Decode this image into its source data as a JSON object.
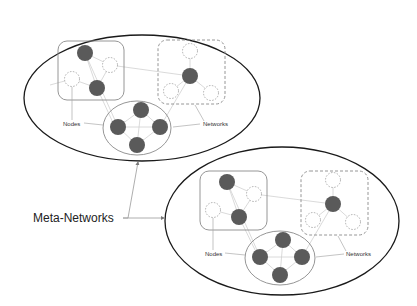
{
  "diagram": {
    "labels": {
      "meta_networks": "Meta-Networks",
      "nodes": "Nodes",
      "networks": "Networks"
    },
    "colors": {
      "background": "#ffffff",
      "outer_ellipse_stroke": "#1a1a1a",
      "box_stroke": "#8a8a8a",
      "filled_node": "#5a5a5a",
      "empty_node_stroke": "#9a9a9a",
      "edge": "#cfcfcf",
      "connector": "#9a9a9a"
    },
    "meta_networks": [
      {
        "id": "top-left",
        "nodes_label": "Nodes",
        "networks_label": "Networks",
        "solid_network": {
          "filled_nodes": 2,
          "empty_nodes": 2
        },
        "dashed_network": {
          "filled_nodes": 1,
          "empty_nodes": 3
        },
        "center_network": {
          "filled_nodes": 4,
          "empty_nodes": 0
        }
      },
      {
        "id": "bottom-right",
        "nodes_label": "Nodes",
        "networks_label": "Networks",
        "solid_network": {
          "filled_nodes": 2,
          "empty_nodes": 2
        },
        "dashed_network": {
          "filled_nodes": 1,
          "empty_nodes": 3
        },
        "center_network": {
          "filled_nodes": 4,
          "empty_nodes": 0
        }
      }
    ]
  }
}
